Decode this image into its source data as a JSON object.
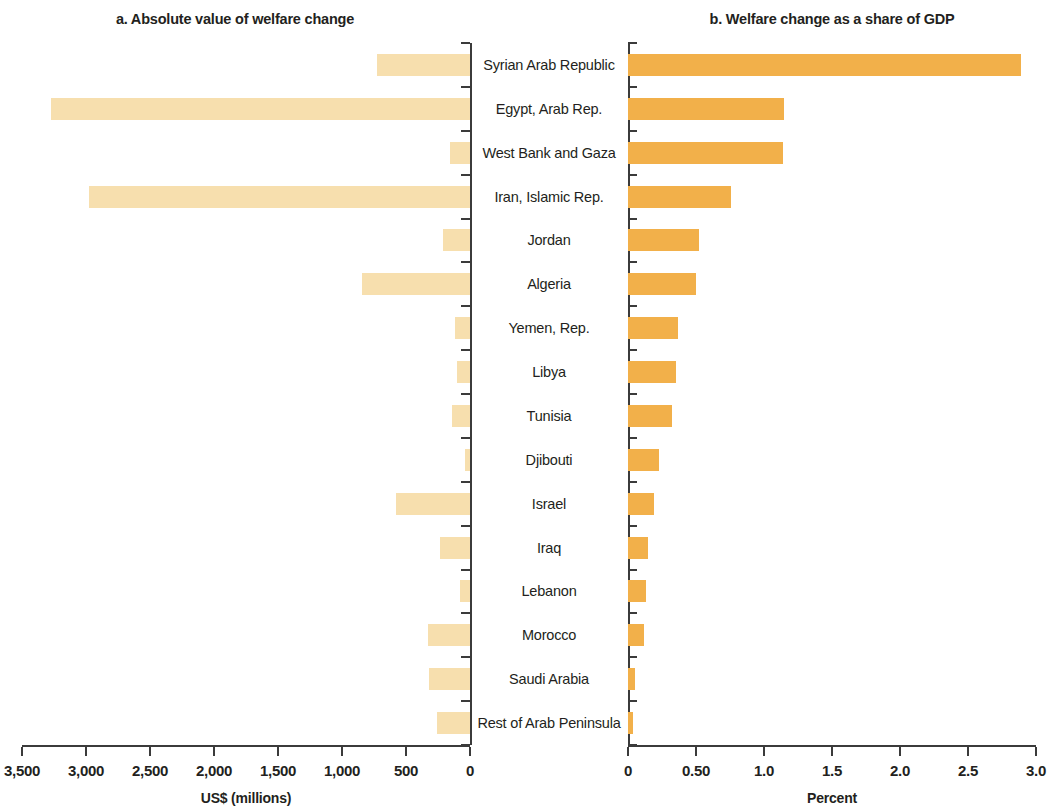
{
  "panels": {
    "a": {
      "title": "a. Absolute value of welfare change",
      "axis_caption": "US$ (millions)"
    },
    "b": {
      "title": "b. Welfare change as a share of GDP",
      "axis_caption": "Percent"
    }
  },
  "colors": {
    "bar_absolute": "#f7dfae",
    "bar_share": "#f2b04a",
    "axis": "#3b3b3b",
    "text": "#231f20",
    "background": "#ffffff"
  },
  "chart_data": {
    "type": "bar",
    "orientation": "horizontal",
    "layout": "back-to-back bidirectional (panel a grows leftward, panel b grows rightward, shared centered category labels)",
    "grid": false,
    "legend": null,
    "categories": [
      "Syrian Arab Republic",
      "Egypt, Arab Rep.",
      "West Bank and Gaza",
      "Iran, Islamic Rep.",
      "Jordan",
      "Algeria",
      "Yemen, Rep.",
      "Libya",
      "Tunisia",
      "Djibouti",
      "Israel",
      "Iraq",
      "Lebanon",
      "Morocco",
      "Saudi Arabia",
      "Rest of Arab Peninsula"
    ],
    "series": [
      {
        "name": "Absolute value of welfare change",
        "panel": "a",
        "unit": "US$ (millions)",
        "xlabel": "US$ (millions)",
        "xlim": [
          3500,
          0
        ],
        "direction": "rtl",
        "ticks": [
          "3,500",
          "3,000",
          "2,500",
          "2,000",
          "1,500",
          "1,000",
          "500",
          "0"
        ],
        "tick_values": [
          3500,
          3000,
          2500,
          2000,
          1500,
          1000,
          500,
          0
        ],
        "values": [
          725,
          3270,
          155,
          2980,
          210,
          845,
          115,
          100,
          140,
          40,
          575,
          235,
          75,
          325,
          320,
          255
        ]
      },
      {
        "name": "Welfare change as a share of GDP",
        "panel": "b",
        "unit": "Percent",
        "xlabel": "Percent",
        "xlim": [
          0,
          3.0
        ],
        "direction": "ltr",
        "ticks": [
          "0",
          "0.50",
          "1.0",
          "1.5",
          "2.0",
          "2.5",
          "3.0"
        ],
        "tick_values": [
          0,
          0.5,
          1.0,
          1.5,
          2.0,
          2.5,
          3.0
        ],
        "values": [
          2.89,
          1.15,
          1.14,
          0.76,
          0.52,
          0.5,
          0.37,
          0.35,
          0.32,
          0.23,
          0.19,
          0.15,
          0.13,
          0.12,
          0.05,
          0.04
        ]
      }
    ]
  }
}
